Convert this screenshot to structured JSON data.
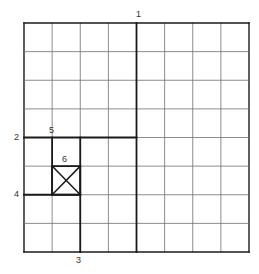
{
  "diagram": {
    "type": "grid-cut-sequence",
    "grid": {
      "columns": 8,
      "rows": 8
    },
    "colors": {
      "grid_line": "#6e6e6e",
      "bold_line": "#1a1a1a",
      "label": "#333333",
      "background": "#ffffff"
    },
    "cuts": [
      {
        "id": "1",
        "label": "1",
        "orientation": "vertical",
        "at_col": 4,
        "from_row": 0,
        "to_row": 8
      },
      {
        "id": "2",
        "label": "2",
        "orientation": "horizontal",
        "at_row": 4,
        "from_col": 0,
        "to_col": 4
      },
      {
        "id": "3",
        "label": "3",
        "orientation": "vertical",
        "at_col": 2,
        "from_row": 4,
        "to_row": 8
      },
      {
        "id": "4",
        "label": "4",
        "orientation": "horizontal",
        "at_row": 6,
        "from_col": 0,
        "to_col": 2
      },
      {
        "id": "5",
        "label": "5",
        "orientation": "vertical",
        "at_col": 1,
        "from_row": 4,
        "to_row": 6
      }
    ],
    "marked_cell": {
      "id": "6",
      "label": "6",
      "col": 1,
      "row": 5,
      "marker": "x-cross"
    }
  }
}
